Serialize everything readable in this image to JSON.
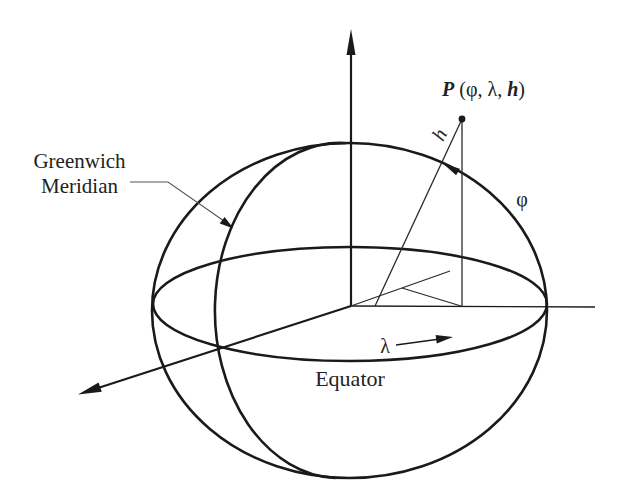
{
  "figure": {
    "colors": {
      "line": "#1a1a1a",
      "thin_line": "#2a2a2a",
      "leader": "#555555",
      "arrowhead": "#1a1a1a",
      "background": "#ffffff"
    },
    "labels": {
      "point": {
        "name": "P",
        "open": " (",
        "phi": "φ",
        "sep1": ", ",
        "lambda": "λ",
        "sep2": ", ",
        "h": "h",
        "close": ")"
      },
      "height": "h",
      "latitude": "φ",
      "longitude": "λ",
      "equator": "Equator",
      "meridian_line1": "Greenwich",
      "meridian_line2": "Meridian"
    },
    "elements": [
      "reference-ellipsoid-outline",
      "equator-ellipse",
      "greenwich-meridian-arc",
      "z-axis-arrow",
      "x-axis-arrow",
      "y-axis-line",
      "point-P",
      "ellipsoidal-height-line",
      "latitude-arrow",
      "longitude-arrow"
    ]
  }
}
